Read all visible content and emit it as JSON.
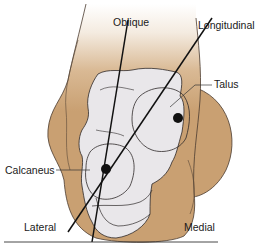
{
  "diagram": {
    "labels": {
      "oblique": "Oblique",
      "longitudinal": "Longitudinal",
      "talus": "Talus",
      "calcaneus": "Calcaneus",
      "lateral": "Lateral",
      "medial": "Medial"
    },
    "colors": {
      "skin": "#c9a072",
      "skin_dark": "#b98e5f",
      "bone": "#e9e7ea",
      "outline": "#3a2f2a",
      "axis_line": "#111111",
      "background": "#ffffff"
    }
  }
}
